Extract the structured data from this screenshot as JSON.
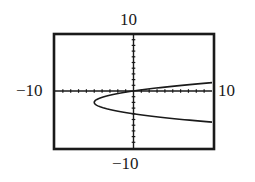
{
  "chart_data": {
    "type": "line",
    "title": "",
    "xlabel": "",
    "ylabel": "",
    "window": {
      "xmin": -10,
      "xmax": 10,
      "ymin": -10,
      "ymax": 10,
      "xscl": 1,
      "yscl": 1
    },
    "grid": false,
    "frame_labels": {
      "top": "10",
      "bottom": "-10",
      "left": "-10",
      "right": "10"
    },
    "series": [
      {
        "name": "sideways parabola x = 1.25(y+2)^2 - 5",
        "description": "Parabola opening right with vertex at (-5, -2), passing through (0, 0) and (0, -4)",
        "vertex": [
          -5,
          -2
        ],
        "points": [
          [
            10,
            1.46
          ],
          [
            7.5,
            1.16
          ],
          [
            5,
            0.83
          ],
          [
            2.5,
            0.45
          ],
          [
            0,
            0
          ],
          [
            -2.5,
            -0.59
          ],
          [
            -4,
            -1.11
          ],
          [
            -5,
            -2
          ],
          [
            -4,
            -2.89
          ],
          [
            -2.5,
            -3.41
          ],
          [
            0,
            -4
          ],
          [
            2.5,
            -4.45
          ],
          [
            5,
            -4.83
          ],
          [
            7.5,
            -5.16
          ],
          [
            10,
            -5.46
          ]
        ]
      }
    ],
    "colors": {
      "axis": "#1a1a1a",
      "curve": "#1a1a1a",
      "frame": "#1a1a1a",
      "background": "#ffffff"
    }
  },
  "labels": {
    "top": "10",
    "bottom": "−10",
    "left": "−10",
    "right": "10"
  }
}
